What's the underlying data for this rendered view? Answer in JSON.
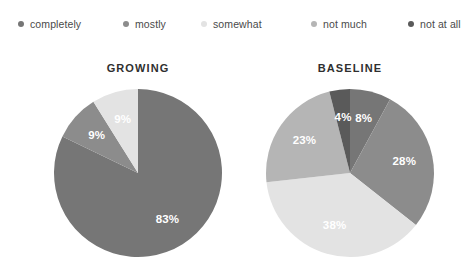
{
  "legend": {
    "items": [
      {
        "label": "completely",
        "color": "#767676",
        "icon": "legend-dot-icon"
      },
      {
        "label": "mostly",
        "color": "#8c8c8c",
        "icon": "legend-dot-icon"
      },
      {
        "label": "somewhat",
        "color": "#e3e3e3",
        "icon": "legend-dot-icon"
      },
      {
        "label": "not much",
        "color": "#b5b5b5",
        "icon": "legend-dot-icon"
      },
      {
        "label": "not at all",
        "color": "#5a5a5a",
        "icon": "legend-dot-icon"
      }
    ]
  },
  "charts": {
    "growing": {
      "title": "GROWING"
    },
    "baseline": {
      "title": "BASELINE"
    }
  },
  "chart_data": [
    {
      "type": "pie",
      "title": "GROWING",
      "categories": [
        "completely",
        "mostly",
        "somewhat",
        "not much",
        "not at all"
      ],
      "values": [
        83,
        9,
        9,
        0,
        0
      ],
      "labels": [
        "83%",
        "9%",
        "9%",
        "",
        ""
      ],
      "colors": [
        "#767676",
        "#8c8c8c",
        "#e3e3e3",
        "#b5b5b5",
        "#5a5a5a"
      ],
      "start_angle_deg": 0,
      "direction": "clockwise",
      "legend_position": "top",
      "xlabel": "",
      "ylabel": ""
    },
    {
      "type": "pie",
      "title": "BASELINE",
      "categories": [
        "completely",
        "mostly",
        "somewhat",
        "not much",
        "not at all"
      ],
      "values": [
        8,
        28,
        38,
        23,
        4
      ],
      "labels": [
        "8%",
        "28%",
        "38%",
        "23%",
        "4%"
      ],
      "colors": [
        "#767676",
        "#8c8c8c",
        "#e3e3e3",
        "#b5b5b5",
        "#5a5a5a"
      ],
      "start_angle_deg": 0,
      "direction": "clockwise",
      "legend_position": "top",
      "xlabel": "",
      "ylabel": ""
    }
  ]
}
